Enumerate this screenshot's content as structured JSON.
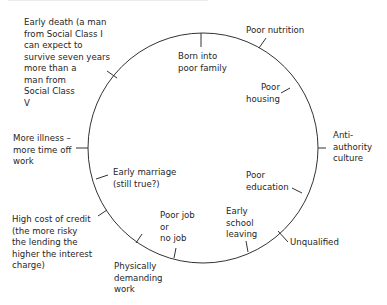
{
  "diagram": {
    "type": "cycle",
    "title_visible": false,
    "circle": {
      "cx": 203,
      "cy": 148,
      "r": 115,
      "stroke": "#333333"
    },
    "labels": {
      "early_death": "Early death (a man\nfrom Social Class I\ncan expect to\nsurvive seven years\nmore than a\nman from\nSocial Class\nV",
      "born_poor": "Born into\npoor family",
      "poor_nutrition": "Poor nutrition",
      "poor_housing": "Poor\nhousing",
      "anti_authority": "Anti-\nauthority\nculture",
      "poor_education": "Poor\neducation",
      "unqualified": "Unqualified",
      "early_school_leaving": "Early\nschool\nleaving",
      "poor_job": "Poor job\nor\nno job",
      "physically_demanding": "Physically\ndemanding\nwork",
      "high_cost_credit": "High cost of credit\n(the more risky\nthe lending the\nhigher the interest\ncharge)",
      "early_marriage": "Early marriage\n(still true?)",
      "more_illness": "More illness –\nmore time off\nwork"
    }
  }
}
